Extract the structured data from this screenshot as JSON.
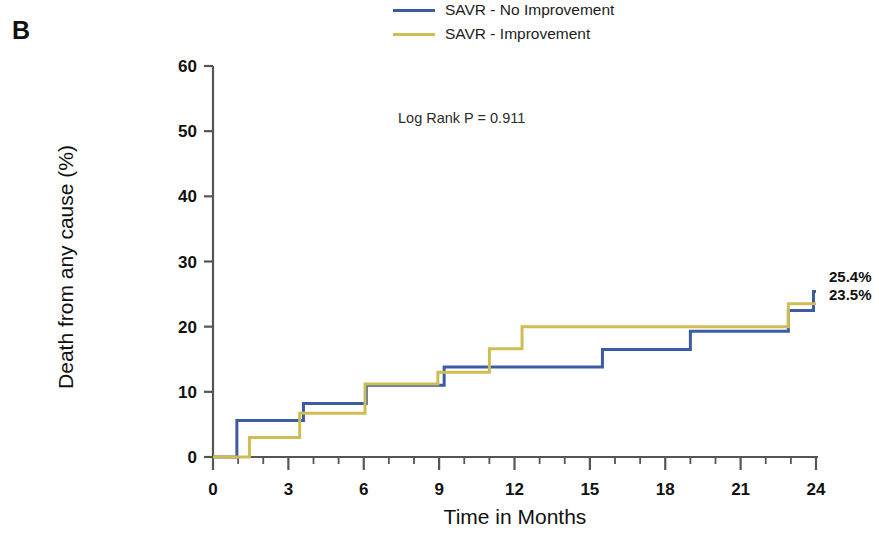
{
  "panel": {
    "label": "B"
  },
  "legend": {
    "position": "top-center",
    "items": [
      {
        "label": "SAVR - No Improvement",
        "color": "#3b5ba5"
      },
      {
        "label": "SAVR - Improvement",
        "color": "#cfbd54"
      }
    ]
  },
  "annotation": {
    "text": "Log Rank P = 0.911"
  },
  "endpoint_labels": [
    {
      "text": "25.4%",
      "series": "SAVR - No Improvement"
    },
    {
      "text": "23.5%",
      "series": "SAVR - Improvement"
    }
  ],
  "axes": {
    "x_label": "Time in Months",
    "y_label": "Death from any cause (%)",
    "x_ticks": [
      "0",
      "3",
      "6",
      "9",
      "12",
      "15",
      "18",
      "21",
      "24"
    ],
    "y_ticks": [
      "0",
      "10",
      "20",
      "30",
      "40",
      "50",
      "60"
    ]
  },
  "chart_data": {
    "type": "line",
    "subtype": "kaplan-meier-step",
    "title": "",
    "xlabel": "Time in Months",
    "ylabel": "Death from any cause (%)",
    "xlim": [
      0,
      24
    ],
    "ylim": [
      0,
      60
    ],
    "x_ticks": [
      0,
      3,
      6,
      9,
      12,
      15,
      18,
      21,
      24
    ],
    "x_minor_tick_step": 1,
    "y_ticks": [
      0,
      10,
      20,
      30,
      40,
      50,
      60
    ],
    "grid": false,
    "legend_position": "top-center",
    "annotations": [
      {
        "text": "Log Rank P = 0.911",
        "x": 9.4,
        "y": 49
      },
      {
        "text": "25.4%",
        "x": 24.4,
        "y": 25.4
      },
      {
        "text": "23.5%",
        "x": 24.4,
        "y": 23.5
      }
    ],
    "series": [
      {
        "name": "SAVR - No Improvement",
        "color": "#3b5ba5",
        "final_value": 25.4,
        "points": [
          [
            0,
            0
          ],
          [
            0.95,
            0
          ],
          [
            0.95,
            5.6
          ],
          [
            3.6,
            5.6
          ],
          [
            3.6,
            8.2
          ],
          [
            6.1,
            8.2
          ],
          [
            6.1,
            11.0
          ],
          [
            9.2,
            11.0
          ],
          [
            9.2,
            13.8
          ],
          [
            15.5,
            13.8
          ],
          [
            15.5,
            16.5
          ],
          [
            19.0,
            16.5
          ],
          [
            19.0,
            19.3
          ],
          [
            22.9,
            19.3
          ],
          [
            22.9,
            22.5
          ],
          [
            23.9,
            22.5
          ],
          [
            23.9,
            25.4
          ],
          [
            24,
            25.4
          ]
        ]
      },
      {
        "name": "SAVR - Improvement",
        "color": "#cfbd54",
        "final_value": 23.5,
        "points": [
          [
            0,
            0
          ],
          [
            1.45,
            0
          ],
          [
            1.45,
            3.0
          ],
          [
            3.45,
            3.0
          ],
          [
            3.45,
            6.7
          ],
          [
            6.05,
            6.7
          ],
          [
            6.05,
            11.2
          ],
          [
            8.95,
            11.2
          ],
          [
            8.95,
            13.0
          ],
          [
            11.0,
            13.0
          ],
          [
            11.0,
            16.6
          ],
          [
            12.3,
            16.6
          ],
          [
            12.3,
            20.0
          ],
          [
            22.9,
            20.0
          ],
          [
            22.9,
            23.5
          ],
          [
            24,
            23.5
          ]
        ]
      }
    ]
  }
}
